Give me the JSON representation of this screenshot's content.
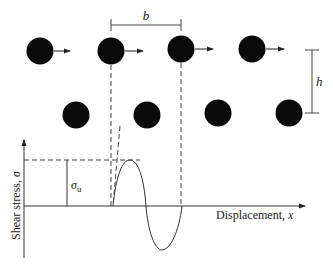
{
  "figure": {
    "dimensions": {
      "spacing_label": "b",
      "row_separation_label": "h"
    },
    "atoms": {
      "top_row": [
        {
          "cx": 40,
          "cy": 51,
          "arrow": true
        },
        {
          "cx": 111,
          "cy": 51,
          "arrow": true
        },
        {
          "cx": 181,
          "cy": 49,
          "arrow": true
        },
        {
          "cx": 252,
          "cy": 49,
          "arrow": true
        }
      ],
      "bottom_row": [
        {
          "cx": 76,
          "cy": 115
        },
        {
          "cx": 147,
          "cy": 115
        },
        {
          "cx": 218,
          "cy": 113
        },
        {
          "cx": 289,
          "cy": 113
        }
      ],
      "radius": 13.5,
      "color": "#0a0a0a"
    },
    "graph": {
      "y_axis_label": "Shear stress, ",
      "y_axis_symbol": "σ",
      "x_axis_label": "Displacement, ",
      "x_axis_symbol": "x",
      "max_stress_label": "σ",
      "max_stress_subscript": "u"
    },
    "line_color": "#333333"
  }
}
